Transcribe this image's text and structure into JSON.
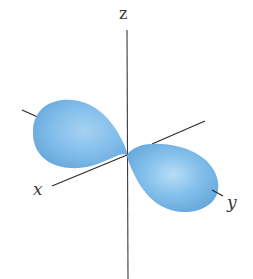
{
  "diagram": {
    "type": "p-orbital",
    "orbital_axis": "y",
    "axes": {
      "z_label": "z",
      "x_label": "x",
      "y_label": "y"
    },
    "colors": {
      "lobe_fill": "#7ab8e8",
      "lobe_highlight": "#b4dcf6",
      "lobe_shadow": "#5c9ed6",
      "axis_line": "#2b2b2b",
      "background": "#ffffff"
    },
    "lobes": [
      {
        "name": "lobe-negative-y",
        "center_px": [
          75,
          135
        ]
      },
      {
        "name": "lobe-positive-y",
        "center_px": [
          173,
          178
        ]
      }
    ],
    "origin_px": [
      127,
      155
    ]
  }
}
